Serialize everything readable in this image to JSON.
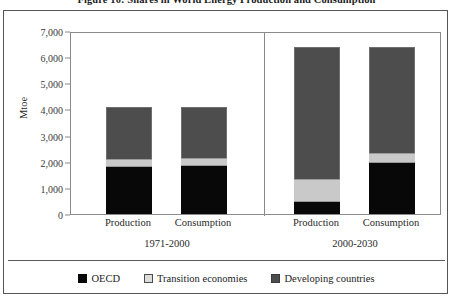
{
  "figure": {
    "caption": "Figure 10: Shares in World Energy Production and Consumption"
  },
  "legend": {
    "position": "bottom-center",
    "items": [
      {
        "label": "OECD",
        "color": "#080808",
        "swatch": "oecd-swatch"
      },
      {
        "label": "Transition economies",
        "color": "#dcdcdc",
        "swatch": "transition-swatch"
      },
      {
        "label": "Developing countries",
        "color": "#4d4d4d",
        "swatch": "developing-swatch"
      }
    ]
  },
  "axis": {
    "y": {
      "title": "Mtoe",
      "ticks": [
        "0",
        "1,000",
        "2,000",
        "3,000",
        "4,000",
        "5,000",
        "6,000",
        "7,000"
      ],
      "min": 0,
      "max": 7000,
      "step": 1000
    },
    "x": {
      "categories": [
        "Production",
        "Consumption",
        "Production",
        "Consumption"
      ],
      "groups": [
        "1971-2000",
        "2000-2030"
      ]
    }
  },
  "chart_data": {
    "type": "bar",
    "title": "Figure 10: Shares in World Energy Production and Consumption",
    "xlabel": "",
    "ylabel": "Mtoe",
    "ylim": [
      0,
      7000
    ],
    "ytick_step": 1000,
    "grid": false,
    "stacked": true,
    "legend_position": "bottom-center",
    "groups": [
      "1971-2000",
      "2000-2030"
    ],
    "categories": [
      "Production",
      "Consumption",
      "Production",
      "Consumption"
    ],
    "series": [
      {
        "name": "OECD",
        "color": "#080808",
        "values": [
          1800,
          1850,
          450,
          1950
        ]
      },
      {
        "name": "Transition economies",
        "color": "#dcdcdc",
        "values": [
          300,
          300,
          900,
          400
        ]
      },
      {
        "name": "Developing countries",
        "color": "#4d4d4d",
        "values": [
          2000,
          1950,
          5050,
          4050
        ]
      }
    ],
    "totals": [
      4100,
      4100,
      6400,
      6400
    ]
  }
}
